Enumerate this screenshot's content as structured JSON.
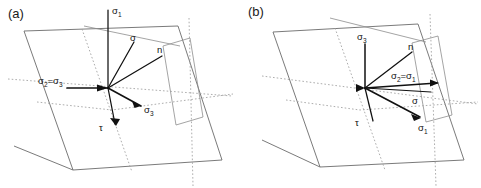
{
  "figure": {
    "type": "stress-tensor-fault-plane-diagram",
    "background_color": "#ffffff",
    "line_color": "#6b6b6b",
    "vector_color": "#111111",
    "dotted_color": "#9a9a9a",
    "width": 481,
    "height": 188
  },
  "panels": [
    {
      "id": "a",
      "label": "(a)",
      "origin": {
        "x": 108,
        "y": 88
      },
      "vectors": [
        {
          "name": "sigma-1-axis",
          "label": "σ",
          "sub": "1",
          "label_text": "σ1",
          "from": [
            108,
            88
          ],
          "to": [
            108,
            10
          ],
          "label_pos": [
            112,
            12
          ],
          "arrow": false,
          "style": "solid"
        },
        {
          "name": "sigma-stress",
          "label": "σ",
          "sub": "",
          "label_text": "σ",
          "from": [
            108,
            88
          ],
          "to": [
            134,
            42
          ],
          "label_pos": [
            131,
            40
          ],
          "arrow": false,
          "style": "solid"
        },
        {
          "name": "normal-vector",
          "label": "n",
          "sub": "",
          "label_text": "n",
          "from": [
            108,
            88
          ],
          "to": [
            162,
            56
          ],
          "label_pos": [
            158,
            52
          ],
          "arrow": false,
          "style": "solid"
        },
        {
          "name": "sigma-2-equals-sigma-3-axis",
          "label": "σ",
          "sub": "2=σ3",
          "label_text": "σ2=σ3",
          "from": [
            108,
            88
          ],
          "to": [
            67,
            88
          ],
          "label_pos": [
            62,
            83
          ],
          "arrow": true,
          "style": "solid"
        },
        {
          "name": "sigma-3-axis",
          "label": "σ",
          "sub": "3",
          "label_text": "σ3",
          "from": [
            108,
            88
          ],
          "to": [
            141,
            106
          ],
          "label_pos": [
            143,
            110
          ],
          "arrow": true,
          "style": "solid"
        },
        {
          "name": "tau-shear",
          "label": "τ",
          "sub": "",
          "label_text": "τ",
          "from": [
            108,
            88
          ],
          "to": [
            116,
            125
          ],
          "label_pos": [
            103,
            128
          ],
          "arrow": true,
          "style": "solid"
        }
      ]
    },
    {
      "id": "b",
      "label": "(b)",
      "origin": {
        "x": 125,
        "y": 88
      },
      "vectors": [
        {
          "name": "sigma-3-axis",
          "label": "σ",
          "sub": "3",
          "label_text": "σ3",
          "from": [
            125,
            88
          ],
          "to": [
            125,
            43
          ],
          "label_pos": [
            119,
            39
          ],
          "arrow": false,
          "style": "solid"
        },
        {
          "name": "normal-vector",
          "label": "n",
          "sub": "",
          "label_text": "n",
          "from": [
            125,
            88
          ],
          "to": [
            172,
            52
          ],
          "label_pos": [
            169,
            48
          ],
          "arrow": false,
          "style": "solid"
        },
        {
          "name": "sigma-2-equals-sigma-1-axis",
          "label": "σ",
          "sub": "2=σ1",
          "label_text": "σ2=σ1",
          "from": [
            125,
            88
          ],
          "to": [
            198,
            83
          ],
          "label_pos": [
            155,
            80
          ],
          "arrow": true,
          "style": "solid"
        },
        {
          "name": "sigma-stress",
          "label": "σ",
          "sub": "",
          "label_text": "σ",
          "from": [
            125,
            88
          ],
          "to": [
            192,
            92
          ],
          "label_pos": [
            173,
            102
          ],
          "arrow": false,
          "style": "solid"
        },
        {
          "name": "sigma-1-axis",
          "label": "σ",
          "sub": "1",
          "label_text": "σ1",
          "from": [
            125,
            88
          ],
          "to": [
            180,
            117
          ],
          "label_pos": [
            180,
            128
          ],
          "arrow": true,
          "style": "solid"
        },
        {
          "name": "tau-shear",
          "label": "τ",
          "sub": "",
          "label_text": "τ",
          "from": [
            125,
            88
          ],
          "to": [
            133,
            122
          ],
          "label_pos": [
            119,
            124
          ],
          "arrow": false,
          "style": "solid"
        }
      ]
    }
  ],
  "labels": {
    "panel_a": "(a)",
    "panel_b": "(b)",
    "sigma": "σ",
    "tau": "τ",
    "n": "n",
    "sigma_1": "σ1",
    "sigma_3": "σ3",
    "sigma_2_eq_sigma_3": "σ2=σ3",
    "sigma_2_eq_sigma_1": "σ2=σ1"
  }
}
